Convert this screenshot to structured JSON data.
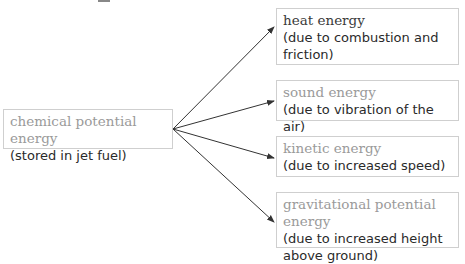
{
  "diagram": {
    "source": {
      "title": "chemical potential energy",
      "description": "(stored in jet fuel)"
    },
    "targets": [
      {
        "title": "heat energy",
        "description": "(due to combustion and friction)"
      },
      {
        "title": "sound energy",
        "description": "(due to vibration of the air)"
      },
      {
        "title": "kinetic energy",
        "description": "(due to increased speed)"
      },
      {
        "title": "gravitational potential energy",
        "description": "(due to increased height above ground)"
      }
    ],
    "colors": {
      "border": "#cfcfcf",
      "title_grey": "#9a9a9a",
      "text": "#2a2a2a",
      "arrow": "#333333"
    }
  }
}
